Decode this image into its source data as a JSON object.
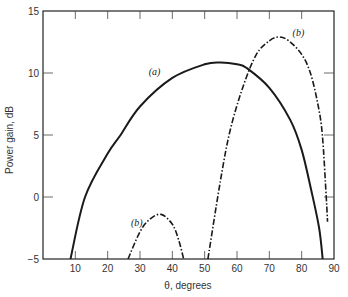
{
  "chart_data": {
    "type": "line",
    "title": "",
    "xlabel": "θ, degrees",
    "ylabel": "Power gain, dB",
    "xlim": [
      0,
      90
    ],
    "ylim": [
      -5,
      15
    ],
    "xticks": [
      10,
      20,
      30,
      40,
      50,
      60,
      70,
      80,
      90
    ],
    "yticks": [
      -5,
      0,
      5,
      10,
      15
    ],
    "xtick_labels": [
      "10",
      "20",
      "30",
      "40",
      "50",
      "60",
      "70",
      "80",
      "90"
    ],
    "ytick_labels": [
      "−5",
      "0",
      "5",
      "10",
      "15"
    ],
    "grid": false,
    "legend": "inline labels",
    "series": [
      {
        "name": "(a)",
        "style": "solid",
        "x": [
          8.5,
          13,
          20,
          24,
          30,
          40,
          50,
          55,
          60,
          63,
          70,
          76.5,
          80,
          83,
          85.4,
          86.5
        ],
        "y": [
          -5,
          0,
          3.5,
          5,
          7.3,
          9.6,
          10.7,
          10.85,
          10.7,
          10.4,
          8.8,
          6.2,
          3.8,
          0.5,
          -2.5,
          -5
        ]
      },
      {
        "name": "(b)",
        "style": "dash-dot",
        "segment": "lower lobe",
        "x": [
          26.3,
          30,
          33,
          36.5,
          40,
          42,
          43.5
        ],
        "y": [
          -5,
          -2.8,
          -1.8,
          -1.4,
          -2.2,
          -3.5,
          -5
        ]
      },
      {
        "name": "(b)",
        "style": "dash-dot",
        "segment": "main lobe",
        "x": [
          51,
          55,
          58,
          62,
          66,
          70,
          73,
          76,
          80,
          82.7,
          85,
          86.4,
          87.6,
          88
        ],
        "y": [
          -5,
          1.5,
          5.5,
          9,
          11.5,
          12.6,
          12.9,
          12.6,
          11.5,
          10,
          7.5,
          5,
          0,
          -2
        ]
      }
    ],
    "annotations": [
      {
        "text": "(a)",
        "x": 34.5,
        "y": 9.8
      },
      {
        "text": "(b)",
        "x": 29,
        "y": -2.3
      },
      {
        "text": "(b)",
        "x": 79,
        "y": 13
      }
    ]
  }
}
